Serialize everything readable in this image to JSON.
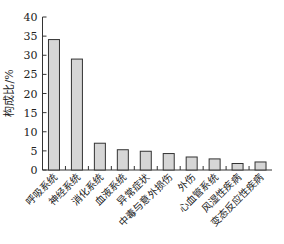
{
  "chart_data": {
    "type": "bar",
    "title": "",
    "xlabel": "",
    "ylabel": "构成比/%",
    "ylim": [
      0,
      40
    ],
    "yticks": [
      0,
      5,
      10,
      15,
      20,
      25,
      30,
      35,
      40
    ],
    "grid": false,
    "legend": null,
    "categories": [
      "呼吸系统",
      "神经系统",
      "消化系统",
      "血液系统",
      "异常症状",
      "中毒与意外损伤",
      "外伤",
      "心血管系统",
      "风湿性疾病",
      "变态反应性疾病"
    ],
    "values": [
      34.1,
      29.0,
      7.0,
      5.3,
      4.9,
      4.3,
      3.4,
      2.9,
      1.7,
      2.1
    ],
    "colors": {
      "bar_fill": "#d6d6d6",
      "bar_stroke": "#333333",
      "axis": "#333333"
    }
  }
}
